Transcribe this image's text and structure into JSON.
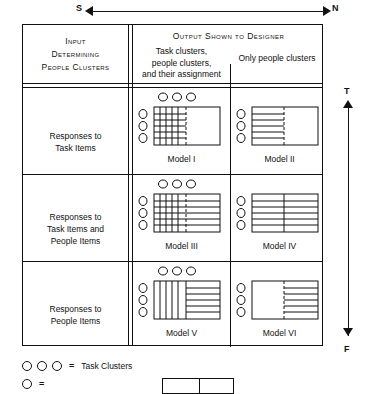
{
  "figure": {
    "top_axis": {
      "left_label": "S",
      "right_label": "N",
      "icon": "double-headed-horizontal-arrow"
    },
    "side_axis": {
      "top_label": "T",
      "bottom_label": "F",
      "icon": "double-headed-vertical-arrow"
    }
  },
  "header": {
    "input_column": {
      "line1": "Input",
      "line2": "Determining",
      "line3": "People Clusters"
    },
    "output_title": "Output Shown to Designer",
    "output_col1": "Task clusters,\npeople clusters,\nand their assignment",
    "output_col1_l1": "Task clusters,",
    "output_col1_l2": "people clusters,",
    "output_col1_l3": "and their assignment",
    "output_col2": "Only people clusters"
  },
  "rows": [
    {
      "label_l1": "Responses to",
      "label_l2": "Task Items",
      "label_l3": "",
      "cells": [
        {
          "model": "Model I",
          "roman": "I",
          "pattern": "grid-left-empty-right",
          "dashed_divider": true
        },
        {
          "model": "Model II",
          "roman": "II",
          "pattern": "hlines-left-empty-right",
          "dashed_divider": true
        }
      ]
    },
    {
      "label_l1": "Responses to",
      "label_l2": "Task Items and",
      "label_l3": "People Items",
      "cells": [
        {
          "model": "Model III",
          "roman": "III",
          "pattern": "grid-left-hlines-right",
          "dashed_divider": true
        },
        {
          "model": "Model IV",
          "roman": "IV",
          "pattern": "hlines-full",
          "dashed_divider": false
        }
      ]
    },
    {
      "label_l1": "Responses to",
      "label_l2": "People Items",
      "label_l3": "",
      "cells": [
        {
          "model": "Model V",
          "roman": "V",
          "pattern": "vlines-left-hlines-right",
          "dashed_divider": false
        },
        {
          "model": "Model VI",
          "roman": "VI",
          "pattern": "empty-left-hlines-right",
          "dashed_divider": true
        }
      ]
    }
  ],
  "legend": [
    {
      "symbol": "three-circles",
      "equals": "=",
      "text": "Task Clusters"
    },
    {
      "symbol": "circle",
      "equals": "=",
      "text": ""
    }
  ],
  "colors": {
    "ink": "#111111",
    "paper": "#ffffff"
  }
}
